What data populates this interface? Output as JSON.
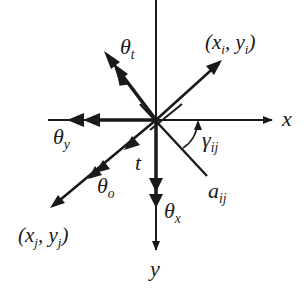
{
  "diagram": {
    "type": "coordinate-vector-diagram",
    "colors": {
      "ink": "#1a1a1a",
      "background": "#ffffff"
    },
    "axes": {
      "x": {
        "label": "x",
        "direction": "right"
      },
      "y": {
        "label": "y",
        "direction": "down"
      }
    },
    "points": {
      "i": {
        "label": "(x",
        "sub1": "i",
        "mid": ", y",
        "sub2": "i",
        "end": ")"
      },
      "j": {
        "label": "(x",
        "sub1": "j",
        "mid": ", y",
        "sub2": "j",
        "end": ")"
      }
    },
    "labels": {
      "theta_t": {
        "base": "θ",
        "sub": "t"
      },
      "theta_y": {
        "base": "θ",
        "sub": "y"
      },
      "theta_o": {
        "base": "θ",
        "sub": "o"
      },
      "theta_x": {
        "base": "θ",
        "sub": "x"
      },
      "t": {
        "base": "t"
      },
      "gamma": {
        "base": "γ",
        "sub": "ij"
      },
      "a": {
        "base": "a",
        "sub": "ij"
      }
    }
  }
}
